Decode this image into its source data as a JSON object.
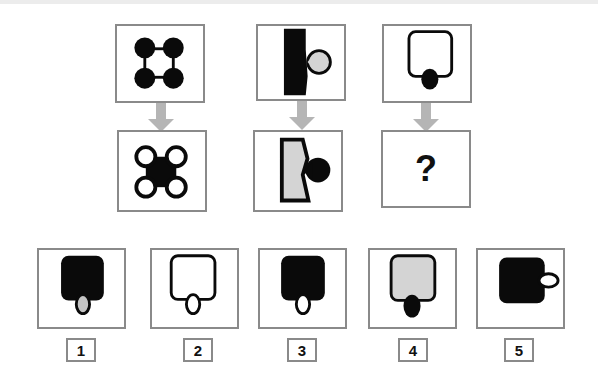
{
  "puzzle": {
    "pairs": [
      {
        "top_figure": "four-black-circles-linked-square",
        "bottom_figure": "black-square-with-four-white-circles"
      },
      {
        "top_figure": "black-shape-with-grey-circle",
        "bottom_figure": "grey-shape-with-black-circle"
      },
      {
        "top_figure": "white-rounded-square-with-black-oval",
        "bottom_figure": "unknown"
      }
    ],
    "question_mark": "?",
    "colors": {
      "border": "#8a8a8a",
      "arrow": "#b5b5b5",
      "black": "#0a0a0a",
      "grey_fill": "#d4d4d4"
    }
  },
  "options": [
    {
      "label": "1",
      "description": "black-rounded-square-grey-oval-bottom"
    },
    {
      "label": "2",
      "description": "white-rounded-square-white-oval-bottom"
    },
    {
      "label": "3",
      "description": "black-rounded-square-white-oval-bottom"
    },
    {
      "label": "4",
      "description": "grey-rounded-square-black-oval-bottom"
    },
    {
      "label": "5",
      "description": "black-rounded-square-white-oval-right"
    }
  ],
  "watermark": "www.gmat..."
}
